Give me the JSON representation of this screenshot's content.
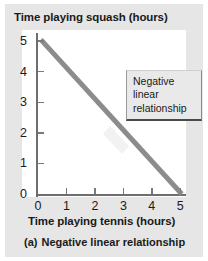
{
  "figure": {
    "caption_label": "(a)",
    "caption_text": "Negative linear relationship",
    "background_color": "#e6e6e6",
    "plot_background_color": "#ffffff"
  },
  "callout": {
    "line1": "Negative",
    "line2": "linear",
    "line3": "relationship",
    "background_color": "#e9e9e9"
  },
  "chart_data": {
    "type": "line",
    "title": "",
    "subtitle": "",
    "xlabel": "Time playing tennis (hours)",
    "ylabel": "Time playing squash (hours)",
    "xlim": [
      0,
      5.2
    ],
    "ylim": [
      0,
      5.2
    ],
    "xticks": [
      0,
      1,
      2,
      3,
      4,
      5
    ],
    "yticks": [
      0,
      1,
      2,
      3,
      4,
      5
    ],
    "xtick_labels": [
      "0",
      "1",
      "2",
      "3",
      "4",
      "5"
    ],
    "ytick_labels": [
      "0",
      "1",
      "2",
      "3",
      "4",
      "5"
    ],
    "grid": false,
    "legend": false,
    "line_color": "#8c8c8c",
    "line_width": 5,
    "series": [
      {
        "name": "Negative linear relationship",
        "x": [
          0.1,
          5.05
        ],
        "values": [
          5.05,
          0.0
        ]
      }
    ],
    "annotations": [
      {
        "text": "Negative linear relationship",
        "x": 3.1,
        "y": 4.2
      }
    ]
  }
}
